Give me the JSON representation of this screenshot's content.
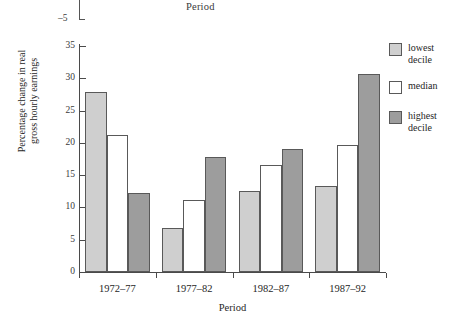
{
  "figure": {
    "stray_top_label": "Period",
    "stray_tick_label": "–5"
  },
  "chart_data": {
    "type": "bar",
    "title": "",
    "xlabel": "Period",
    "ylabel": "Percentage change in real\ngross hourly earnings",
    "categories": [
      "1972–77",
      "1977–82",
      "1982–87",
      "1987–92"
    ],
    "series": [
      {
        "name": "lowest\ndecile",
        "key": "lowest",
        "color": "#cfcfcf",
        "values": [
          27.9,
          6.8,
          12.6,
          13.3
        ]
      },
      {
        "name": "median",
        "key": "median",
        "color": "#ffffff",
        "values": [
          21.2,
          11.2,
          16.5,
          19.7
        ]
      },
      {
        "name": "highest\ndecile",
        "key": "highest",
        "color": "#9d9d9d",
        "values": [
          12.3,
          17.8,
          19.0,
          30.7
        ]
      }
    ],
    "ylim": [
      0,
      35
    ],
    "yticks": [
      0,
      5,
      10,
      15,
      20,
      25,
      30,
      35
    ],
    "ytick_labels": [
      "0",
      "5",
      "10",
      "15",
      "20",
      "25",
      "30",
      "35"
    ],
    "grid": false,
    "legend_position": "right"
  }
}
